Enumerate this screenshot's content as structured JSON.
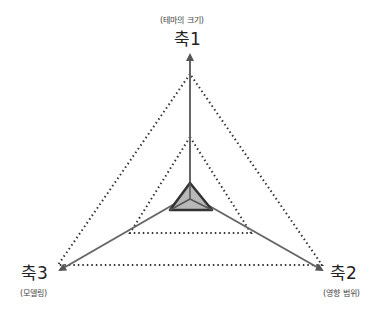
{
  "axes": [
    {
      "name": "축1",
      "subtitle": "(테마의 크기)"
    },
    {
      "name": "축2",
      "subtitle": "(영향 범위)"
    },
    {
      "name": "축3",
      "subtitle": "(모델링)"
    }
  ],
  "colors": {
    "axis": "#666666",
    "dotted": "#333333",
    "fill": "#b8b8b8",
    "fill_stroke": "#333333"
  }
}
